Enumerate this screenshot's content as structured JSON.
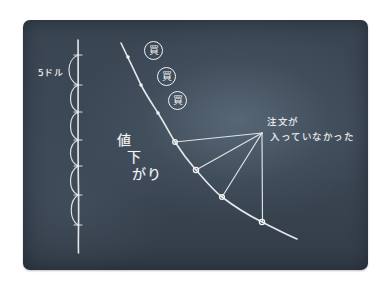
{
  "diagram": {
    "style": "chalkboard-sketch",
    "colors": {
      "board": "#3a4552",
      "chalk": "#f2f4f5",
      "background": "#ffffff"
    },
    "axis": {
      "unit_label": "5ドル",
      "interval_count": 6
    },
    "buy_badges": [
      {
        "label": "買"
      },
      {
        "label": "買"
      },
      {
        "label": "買"
      }
    ],
    "curve_label": {
      "chars": [
        "値",
        "下",
        "が",
        "り"
      ],
      "text": "値下がり"
    },
    "annotation": {
      "line1": "注文が",
      "line2": "入っていなかった",
      "pointed_points_count": 4
    }
  }
}
